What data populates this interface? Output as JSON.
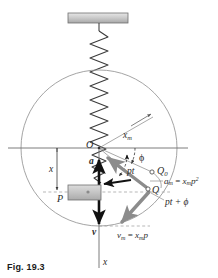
{
  "figure": {
    "caption": "Fig. 19.3"
  },
  "labels": {
    "origin": "O",
    "point_P": "P",
    "point_Q": "Q",
    "point_Q0": "Q",
    "point_Q0_sub": "0",
    "displacement_x": "x",
    "axis_x": "x",
    "amplitude": "x",
    "amplitude_sub": "m",
    "acceleration_vector": "a",
    "velocity_vector": "v",
    "phase_angle": "ϕ",
    "angle_pt": "pt",
    "angle_pt_phi": "pt + ϕ",
    "accel_mag_lhs": "a",
    "accel_mag_lhs_sub": "m",
    "accel_mag_eq": " = ",
    "accel_mag_rhs": "x",
    "accel_mag_rhs_sub": "m",
    "accel_mag_p": "p",
    "accel_mag_exp": "2",
    "vel_mag_lhs": "v",
    "vel_mag_lhs_sub": "m",
    "vel_mag_eq": " = ",
    "vel_mag_rhs": "x",
    "vel_mag_rhs_sub": "m",
    "vel_mag_p": "p"
  },
  "geometry": {
    "circle_center_x": 99,
    "circle_center_y": 148,
    "circle_radius": 78,
    "origin_x": 99,
    "origin_y": 148,
    "Q_x": 148,
    "Q_y": 189,
    "Q0_x": 152,
    "Q0_y": 172,
    "block_x": 68,
    "block_y": 185,
    "block_w": 33,
    "block_h": 15,
    "ceiling_x": 68,
    "ceiling_y": 13,
    "ceiling_w": 60,
    "ceiling_h": 10
  },
  "colors": {
    "circle_stroke": "#9a9a9a",
    "axis_stroke": "#6e6e6e",
    "spring_stroke": "#3a3a3a",
    "vector_dark": "#111111",
    "vector_gray": "#8c8c8c",
    "block_fill": "#c9c9c9",
    "ceiling_fill": "#c4c4c4",
    "label_color": "#2b2b2b",
    "background": "#ffffff"
  }
}
